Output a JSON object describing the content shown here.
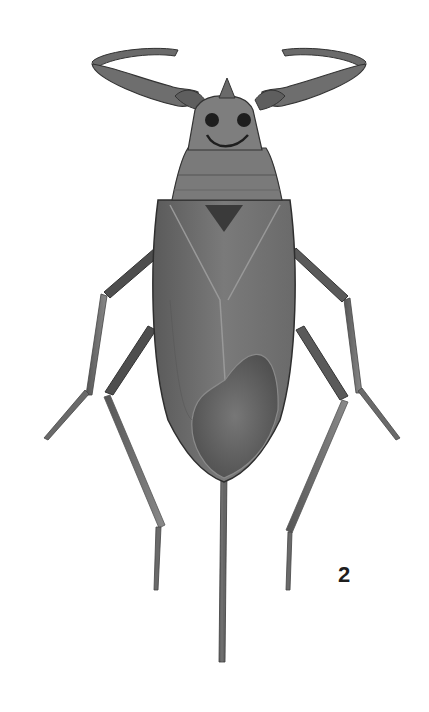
{
  "figure": {
    "number": "2",
    "colors": {
      "background": "#ffffff",
      "body_dark": "#4a4a4a",
      "body_mid": "#6e6e6e",
      "body_light": "#9a9a9a",
      "outline": "#2a2a2a"
    }
  }
}
